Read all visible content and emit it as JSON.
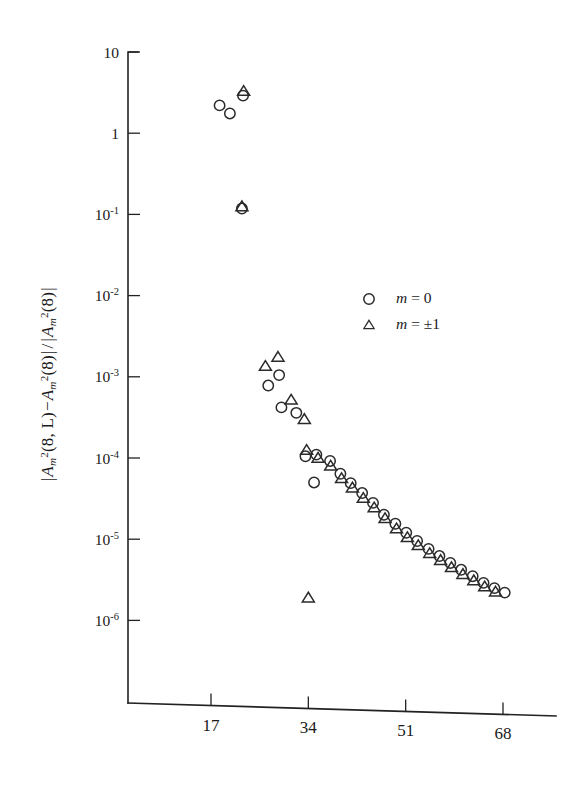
{
  "figure": {
    "ylabel_parts": {
      "abs_open": "|",
      "a": "A",
      "m": "m",
      "sq": "2",
      "arg_l": "(8, L)",
      "minus": "−",
      "arg_0": "(8)",
      "abs_close": "|",
      "slash": "/",
      "denom_abs_open": "|",
      "denom_arg": "(8)",
      "denom_abs_close": "|"
    },
    "ylabel_text": "|A_m^2(8, L) − A_m^2(8)| / |A_m^2(8)|"
  },
  "chart_data": {
    "type": "scatter",
    "title": "",
    "xlabel": "",
    "ylabel": "|A_m^2(8,L) - A_m^2(8)| / |A_m^2(8)|",
    "xscale": "linear",
    "yscale": "log",
    "xlim": [
      3,
      75
    ],
    "ylim": [
      3.2e-07,
      10
    ],
    "grid": false,
    "legend_position": "center-right",
    "xticks": [
      17,
      34,
      51,
      68
    ],
    "xtick_labels": [
      "17",
      "34",
      "51",
      "68"
    ],
    "yticks": [
      10,
      1,
      0.1,
      0.01,
      0.001,
      0.0001,
      1e-05,
      1e-06
    ],
    "ytick_labels": [
      "10",
      "1",
      "10⁻¹",
      "10⁻²",
      "10⁻³",
      "10⁻⁴",
      "10⁻⁵",
      "10⁻⁶"
    ],
    "ytick_mantissa": [
      "10",
      "1",
      "10",
      "10",
      "10",
      "10",
      "10",
      "10"
    ],
    "ytick_exponent": [
      "",
      "",
      "-1",
      "-2",
      "-3",
      "-4",
      "-5",
      "-6"
    ],
    "legend": [
      {
        "marker": "circle",
        "label_var": "m",
        "label_eq": "= 0"
      },
      {
        "marker": "triangle",
        "label_var": "m",
        "label_eq": "= ±1"
      }
    ],
    "series": [
      {
        "name": "m = 0",
        "marker": "circle",
        "points": [
          [
            18.5,
            2.2
          ],
          [
            20.3,
            1.75
          ],
          [
            22.6,
            2.9
          ],
          [
            22.4,
            0.118
          ],
          [
            27.0,
            0.00078
          ],
          [
            28.9,
            0.00105
          ],
          [
            29.3,
            0.00042
          ],
          [
            31.9,
            0.00036
          ],
          [
            33.5,
            0.000105
          ],
          [
            35.4,
            0.00011
          ],
          [
            35.0,
            5e-05
          ],
          [
            37.8,
            9.2e-05
          ],
          [
            39.6,
            6.4e-05
          ],
          [
            41.4,
            4.9e-05
          ],
          [
            43.4,
            3.7e-05
          ],
          [
            45.3,
            2.8e-05
          ],
          [
            47.2,
            2e-05
          ],
          [
            49.2,
            1.55e-05
          ],
          [
            51.1,
            1.2e-05
          ],
          [
            53.0,
            9.5e-06
          ],
          [
            55.0,
            7.6e-06
          ],
          [
            56.9,
            6.2e-06
          ],
          [
            58.8,
            5.1e-06
          ],
          [
            60.7,
            4.2e-06
          ],
          [
            62.7,
            3.5e-06
          ],
          [
            64.6,
            2.9e-06
          ],
          [
            66.5,
            2.5e-06
          ],
          [
            68.3,
            2.2e-06
          ]
        ]
      },
      {
        "name": "m = ±1",
        "marker": "triangle",
        "points": [
          [
            22.7,
            3.3
          ],
          [
            22.4,
            0.125
          ],
          [
            26.5,
            0.00135
          ],
          [
            28.7,
            0.00175
          ],
          [
            31.0,
            0.00052
          ],
          [
            33.3,
            0.0003
          ],
          [
            33.7,
            0.000125
          ],
          [
            34.0,
            1.9e-06
          ],
          [
            35.7,
            0.0001
          ],
          [
            37.9,
            8e-05
          ],
          [
            39.8,
            5.6e-05
          ],
          [
            41.7,
            4.3e-05
          ],
          [
            43.6,
            3.2e-05
          ],
          [
            45.5,
            2.45e-05
          ],
          [
            47.4,
            1.8e-05
          ],
          [
            49.4,
            1.35e-05
          ],
          [
            51.3,
            1.05e-05
          ],
          [
            53.2,
            8.4e-06
          ],
          [
            55.2,
            6.7e-06
          ],
          [
            57.1,
            5.5e-06
          ],
          [
            59.0,
            4.5e-06
          ],
          [
            61.0,
            3.7e-06
          ],
          [
            62.9,
            3.1e-06
          ],
          [
            64.8,
            2.6e-06
          ],
          [
            66.7,
            2.25e-06
          ]
        ]
      }
    ]
  }
}
